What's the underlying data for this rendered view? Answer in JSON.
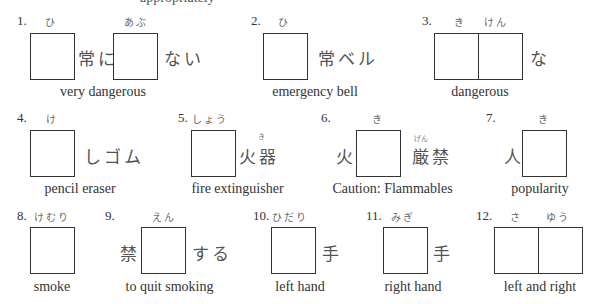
{
  "header": {
    "partial_instruction_text": "appropriately"
  },
  "items": [
    {
      "number": "1.",
      "readings": [
        "ひ",
        "あぶ"
      ],
      "text_segments": [
        "常に",
        "ない"
      ],
      "caption": "very dangerous"
    },
    {
      "number": "2.",
      "readings": [
        "ひ"
      ],
      "text_segments": [
        "常ベル"
      ],
      "caption": "emergency bell"
    },
    {
      "number": "3.",
      "readings": [
        "き",
        "けん"
      ],
      "text_segments": [
        "な"
      ],
      "caption": "dangerous"
    },
    {
      "number": "4.",
      "readings": [
        "け"
      ],
      "text_segments": [
        "しゴム"
      ],
      "caption": "pencil eraser"
    },
    {
      "number": "5.",
      "readings": [
        "しょう"
      ],
      "text_segments": [
        "火器"
      ],
      "small_furigana": "き",
      "caption": "fire extinguisher"
    },
    {
      "number": "6.",
      "readings": [
        "き"
      ],
      "text_segments": [
        "火",
        "厳禁"
      ],
      "small_furigana": "げん",
      "caption": "Caution: Flammables"
    },
    {
      "number": "7.",
      "readings": [
        "き"
      ],
      "text_segments": [
        "人"
      ],
      "caption": "popularity"
    },
    {
      "number": "8.",
      "readings": [
        "けむり"
      ],
      "text_segments": [],
      "caption": "smoke"
    },
    {
      "number": "9.",
      "readings": [
        "えん"
      ],
      "text_segments": [
        "禁",
        "する"
      ],
      "caption": "to quit smoking"
    },
    {
      "number": "10.",
      "readings": [
        "ひだり"
      ],
      "text_segments": [
        "手"
      ],
      "caption": "left hand"
    },
    {
      "number": "11.",
      "readings": [
        "みぎ"
      ],
      "text_segments": [
        "手"
      ],
      "caption": "right hand"
    },
    {
      "number": "12.",
      "readings": [
        "さ",
        "ゆう"
      ],
      "text_segments": [],
      "caption": "left and right"
    }
  ]
}
